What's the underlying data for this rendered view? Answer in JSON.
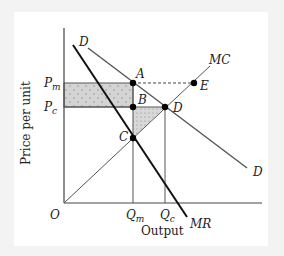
{
  "diagram": {
    "title": "",
    "axes": {
      "y_label": "Price per unit",
      "x_label": "Output",
      "origin_label": "O"
    },
    "price_labels": {
      "pm_main": "P",
      "pm_sub": "m",
      "pc_main": "P",
      "pc_sub": "c"
    },
    "quantity_labels": {
      "qm_main": "Q",
      "qm_sub": "m",
      "qc_main": "Q",
      "qc_sub": "c"
    },
    "curves": {
      "demand_top": "D",
      "demand_bottom": "D",
      "marginal_cost": "MC",
      "marginal_revenue": "MR"
    },
    "points": {
      "A": "A",
      "B": "B",
      "C": "C",
      "D": "D",
      "E": "E"
    },
    "colors": {
      "shade": "#d2d2d2",
      "lines": "#555555",
      "mr_line": "#111111",
      "points": "#000000"
    }
  }
}
